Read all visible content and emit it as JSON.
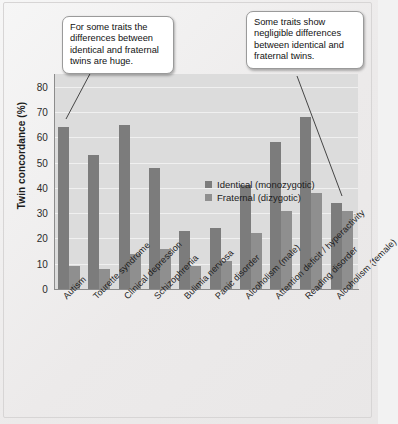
{
  "chart_data": {
    "type": "bar",
    "title": "",
    "xlabel": "",
    "ylabel": "Twin concordance (%)",
    "ylim": [
      0,
      85
    ],
    "yticks": [
      0,
      10,
      20,
      30,
      40,
      50,
      60,
      70,
      80
    ],
    "grid": true,
    "legend_position": "inside-top-center",
    "categories": [
      "Autism",
      "Tourette syndrome",
      "Clinical depression",
      "Schizophrenia",
      "Bulimia nervosa",
      "Panic disorder",
      "Alcoholism (male)",
      "Attention deficit / hyperactivity",
      "Reading disorder",
      "Alcoholism (female)"
    ],
    "series": [
      {
        "name": "Identical (monozygotic)",
        "color": "#7c7c7c",
        "values": [
          64,
          53,
          65,
          48,
          23,
          24,
          41,
          58,
          68,
          34
        ]
      },
      {
        "name": "Fraternal (dizygotic)",
        "color": "#8f8f8f",
        "values": [
          9,
          8,
          14,
          16,
          9,
          11,
          22,
          31,
          38,
          31
        ]
      }
    ],
    "annotations": [
      {
        "id": "callout-left",
        "text": "For some traits the differences between identical and fraternal twins are huge.",
        "points_to": "Autism"
      },
      {
        "id": "callout-right",
        "text": "Some traits show negligible differences between identical and fraternal twins.",
        "points_to": "Alcoholism (female)"
      }
    ]
  }
}
